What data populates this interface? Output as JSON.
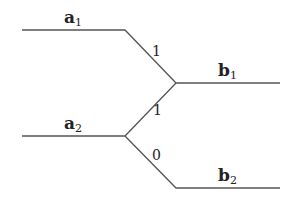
{
  "diagram": {
    "inputs": [
      {
        "name": "a",
        "sub": "1"
      },
      {
        "name": "a",
        "sub": "2"
      }
    ],
    "outputs": [
      {
        "name": "b",
        "sub": "1"
      },
      {
        "name": "b",
        "sub": "2"
      }
    ],
    "edges": [
      {
        "from": "a1",
        "to": "b1",
        "weight": "1"
      },
      {
        "from": "a2",
        "to": "b1",
        "weight": "1"
      },
      {
        "from": "a2",
        "to": "b2",
        "weight": "0"
      }
    ],
    "line_color": "#555555"
  }
}
